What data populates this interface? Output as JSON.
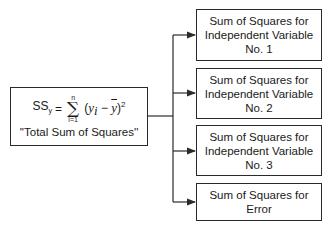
{
  "source": {
    "formula": {
      "lhs": "SS",
      "lhs_sub": "y",
      "equals": "=",
      "sum_upper": "n",
      "sum_symbol": "∑",
      "sum_lower": "i=1",
      "term_open": "(",
      "y": "y",
      "y_sub": "i",
      "minus": " − ",
      "ybar": "y",
      "term_close": ")",
      "power": "2"
    },
    "caption": "''Total Sum of Squares''"
  },
  "targets": [
    {
      "lines": [
        "Sum of Squares for",
        "Independent Variable",
        "No. 1"
      ]
    },
    {
      "lines": [
        "Sum of Squares for",
        "Independent Variable",
        "No. 2"
      ]
    },
    {
      "lines": [
        "Sum of Squares for",
        "Independent Variable",
        "No. 3"
      ]
    },
    {
      "lines": [
        "Sum of Squares for",
        "Error"
      ]
    }
  ],
  "colors": {
    "line": "#2a2a2a",
    "background": "#ffffff"
  }
}
